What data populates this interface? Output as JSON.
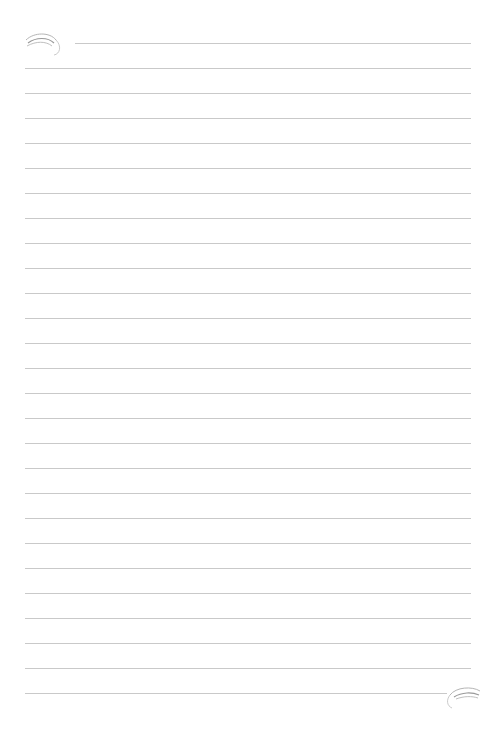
{
  "page": {
    "type": "lined-notepaper",
    "background_color": "#ffffff",
    "line_color": "#c9c9c9",
    "line_count": 27,
    "line_spacing_px": 25,
    "first_line_y": 43,
    "line_left_x": 25,
    "line_right_x": 471,
    "first_line_left_x": 75,
    "last_line_right_x": 447
  },
  "decorations": {
    "top_left": "flourish-icon",
    "bottom_right": "flourish-icon"
  }
}
